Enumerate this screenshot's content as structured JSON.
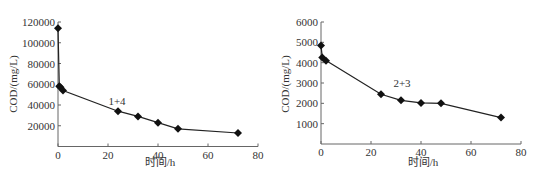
{
  "chart_data": [
    {
      "type": "line",
      "title": "",
      "annotation": "1+4",
      "xlabel": "时间/h",
      "ylabel": "COD/(mg/L)",
      "xlim": [
        0,
        80
      ],
      "ylim": [
        0,
        120000
      ],
      "xticks": [
        0,
        20,
        40,
        60,
        80
      ],
      "yticks": [
        20000,
        40000,
        60000,
        80000,
        100000,
        120000
      ],
      "grid": false,
      "legend": "none",
      "marker": "diamond",
      "series": [
        {
          "name": "1+4",
          "x": [
            0,
            0.5,
            1,
            2,
            24,
            32,
            40,
            48,
            72
          ],
          "y": [
            114000,
            58000,
            57000,
            54000,
            34000,
            29000,
            23000,
            17000,
            13000
          ]
        }
      ]
    },
    {
      "type": "line",
      "title": "",
      "annotation": "2+3",
      "xlabel": "时间/h",
      "ylabel": "COD/(mg/L)",
      "xlim": [
        0,
        80
      ],
      "ylim": [
        0,
        6000
      ],
      "xticks": [
        0,
        20,
        40,
        60,
        80
      ],
      "yticks": [
        1000,
        2000,
        3000,
        4000,
        5000,
        6000
      ],
      "grid": false,
      "legend": "none",
      "marker": "diamond",
      "series": [
        {
          "name": "2+3",
          "x": [
            0,
            0.5,
            2,
            24,
            32,
            40,
            48,
            72
          ],
          "y": [
            4850,
            4250,
            4100,
            2450,
            2150,
            2020,
            2000,
            1300
          ]
        }
      ]
    }
  ],
  "charts": [
    {
      "annotation": "1+4",
      "xlabel": "时间/h",
      "ylabel": "COD/(mg/L)",
      "xtick_labels": [
        "0",
        "20",
        "40",
        "60",
        "80"
      ],
      "ytick_labels": [
        "20000",
        "40000",
        "60000",
        "80000",
        "100000",
        "120000"
      ]
    },
    {
      "annotation": "2+3",
      "xlabel": "时间/h",
      "ylabel": "COD/(mg/L)",
      "xtick_labels": [
        "0",
        "20",
        "40",
        "60",
        "80"
      ],
      "ytick_labels": [
        "1000",
        "2000",
        "3000",
        "4000",
        "5000",
        "6000"
      ]
    }
  ]
}
